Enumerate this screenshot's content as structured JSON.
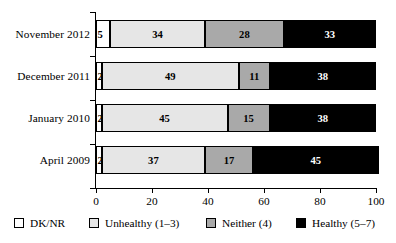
{
  "chart_data": {
    "type": "bar",
    "orientation": "horizontal",
    "stacked": true,
    "percent_stacked": true,
    "title": "",
    "subtitle": "",
    "xlabel": "",
    "ylabel": "",
    "xlim": [
      0,
      100
    ],
    "xticks": [
      0,
      20,
      40,
      60,
      80,
      100
    ],
    "xticklabels": [
      "0",
      "20",
      "40",
      "60",
      "80",
      "100"
    ],
    "grid": false,
    "legend_position": "bottom",
    "categories": [
      "November 2012",
      "December 2011",
      "January 2010",
      "April 2009"
    ],
    "series": [
      {
        "name": "DK/NR",
        "color": "#ffffff",
        "values": [
          5,
          2,
          2,
          2
        ]
      },
      {
        "name": "Unhealthy (1–3)",
        "color": "#e6e6e6",
        "values": [
          34,
          49,
          45,
          37
        ]
      },
      {
        "name": "Neither (4)",
        "color": "#a9a9a9",
        "values": [
          28,
          11,
          15,
          17
        ]
      },
      {
        "name": "Healthy (5–7)",
        "color": "#000000",
        "values": [
          33,
          38,
          38,
          45
        ]
      }
    ],
    "rows": [
      {
        "category": "November 2012",
        "segments": [
          {
            "series": "DK/NR",
            "value": 5,
            "label": "5"
          },
          {
            "series": "Unhealthy (1–3)",
            "value": 34,
            "label": "34"
          },
          {
            "series": "Neither (4)",
            "value": 28,
            "label": "28"
          },
          {
            "series": "Healthy (5–7)",
            "value": 33,
            "label": "33"
          }
        ]
      },
      {
        "category": "December 2011",
        "segments": [
          {
            "series": "DK/NR",
            "value": 2,
            "label": "2"
          },
          {
            "series": "Unhealthy (1–3)",
            "value": 49,
            "label": "49"
          },
          {
            "series": "Neither (4)",
            "value": 11,
            "label": "11"
          },
          {
            "series": "Healthy (5–7)",
            "value": 38,
            "label": "38"
          }
        ]
      },
      {
        "category": "January 2010",
        "segments": [
          {
            "series": "DK/NR",
            "value": 2,
            "label": "2"
          },
          {
            "series": "Unhealthy (1–3)",
            "value": 45,
            "label": "45"
          },
          {
            "series": "Neither (4)",
            "value": 15,
            "label": "15"
          },
          {
            "series": "Healthy (5–7)",
            "value": 38,
            "label": "38"
          }
        ]
      },
      {
        "category": "April 2009",
        "segments": [
          {
            "series": "DK/NR",
            "value": 2,
            "label": "2"
          },
          {
            "series": "Unhealthy (1–3)",
            "value": 37,
            "label": "37"
          },
          {
            "series": "Neither (4)",
            "value": 17,
            "label": "17"
          },
          {
            "series": "Healthy (5–7)",
            "value": 45,
            "label": "45"
          }
        ]
      }
    ]
  },
  "legend": {
    "items": [
      {
        "label": "DK/NR",
        "swatch": "dknr"
      },
      {
        "label": "Unhealthy (1–3)",
        "swatch": "unh"
      },
      {
        "label": "Neither (4)",
        "swatch": "neith"
      },
      {
        "label": "Healthy (5–7)",
        "swatch": "heal"
      }
    ]
  }
}
